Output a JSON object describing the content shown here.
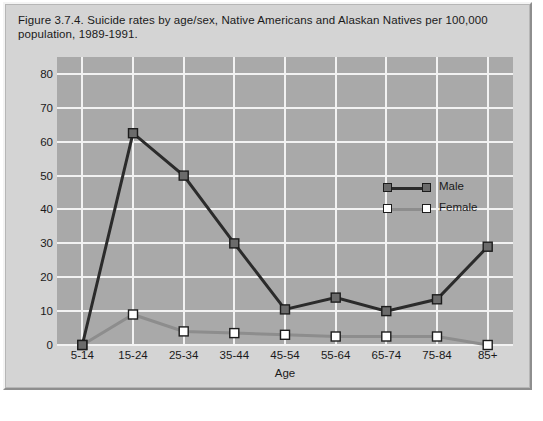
{
  "figure": {
    "title": "Figure 3.7.4. Suicide rates by age/sex, Native Americans and Alaskan Natives per 100,000 population, 1989-1991."
  },
  "legend": {
    "items": [
      {
        "label": "Male",
        "color": "#666666",
        "marker_fill": "#6b6b6b",
        "marker_stroke": "#1c1c1c"
      },
      {
        "label": "Female",
        "color": "#8d8d8d",
        "marker_fill": "#ffffff",
        "marker_stroke": "#1c1c1c"
      }
    ]
  },
  "colors": {
    "page_background": "#ffffff",
    "panel_background": "#d4d4d4",
    "plot_background": "#a9a9a9",
    "gridline": "#f2f2f2",
    "text": "#1a1a1a",
    "male_line": "#2b2b2b",
    "female_line": "#8d8d8d"
  },
  "chart_data": {
    "type": "line",
    "title": "Figure 3.7.4. Suicide rates by age/sex, Native Americans and Alaskan Natives per 100,000 population, 1989-1991.",
    "xlabel": "Age",
    "ylabel": "",
    "categories": [
      "5-14",
      "15-24",
      "25-34",
      "35-44",
      "45-54",
      "55-64",
      "65-74",
      "75-84",
      "85+"
    ],
    "series": [
      {
        "name": "Male",
        "values": [
          0,
          62.5,
          50,
          30,
          10.5,
          14,
          10,
          13.5,
          29
        ]
      },
      {
        "name": "Female",
        "values": [
          0,
          9,
          4,
          3.5,
          3,
          2.5,
          2.5,
          2.5,
          0
        ]
      }
    ],
    "ylim": [
      0,
      85
    ],
    "yticks": [
      0,
      10,
      20,
      30,
      40,
      50,
      60,
      70,
      80
    ],
    "ytick_labels": [
      "0",
      "10",
      "20",
      "30",
      "40",
      "50",
      "60",
      "70",
      "80"
    ],
    "grid": true,
    "legend_position": "inside-center-right"
  }
}
